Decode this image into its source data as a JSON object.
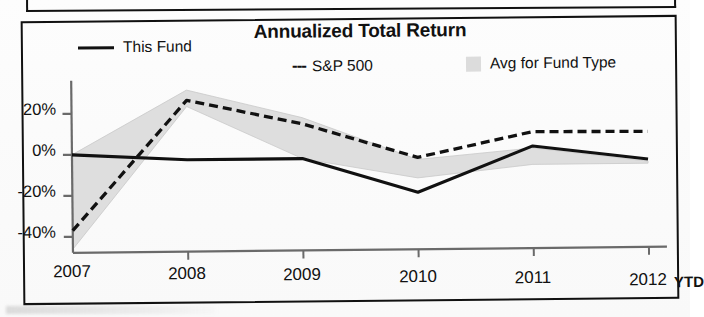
{
  "chart_data": {
    "type": "line",
    "title": "Annualized Total Return",
    "xlabel": "",
    "ylabel": "",
    "categories": [
      "2007",
      "2008",
      "2009",
      "2010",
      "2011",
      "2012"
    ],
    "x_axis_suffix": "YTD",
    "ytick_labels": [
      "20%",
      "0%",
      "-20%",
      "-40%"
    ],
    "ytick_values": [
      20,
      0,
      -20,
      -40
    ],
    "ylim": [
      -48,
      34
    ],
    "grid": false,
    "legend_position": "top",
    "series": [
      {
        "name": "This Fund",
        "style": "solid",
        "color": "#111111",
        "values": [
          0,
          -3,
          -3,
          -20,
          2,
          -5
        ]
      },
      {
        "name": "S&P 500",
        "style": "dashed",
        "color": "#111111",
        "values": [
          -37,
          26,
          14,
          -3,
          9,
          8.5
        ]
      },
      {
        "name": "Avg for Fund Type",
        "style": "band",
        "color": "#dcdcdc",
        "upper": [
          0,
          31,
          17,
          -4,
          1,
          -6
        ],
        "lower": [
          -46,
          23,
          -3,
          -13,
          -7,
          -7
        ]
      }
    ]
  },
  "legend": {
    "fund": "This Fund",
    "sp500": "S&P 500",
    "sp500_prefix": "---",
    "avg": "Avg for Fund Type"
  },
  "axis": {
    "y": [
      "20%",
      "0%",
      "-20%",
      "-40%"
    ],
    "x": [
      "2007",
      "2008",
      "2009",
      "2010",
      "2011",
      "2012"
    ],
    "ytd": "YTD"
  },
  "colors": {
    "line": "#111111",
    "band": "#dcdcdc",
    "frame": "#111111",
    "axis": "#555555"
  }
}
